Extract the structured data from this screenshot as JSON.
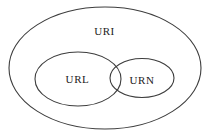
{
  "diagram": {
    "type": "euler",
    "sets": [
      {
        "label": "URI"
      },
      {
        "label": "URL"
      },
      {
        "label": "URN"
      }
    ]
  },
  "colors": {
    "background": "#ffffff",
    "stroke": "#3d3d3d",
    "text": "#1c1c1c"
  }
}
